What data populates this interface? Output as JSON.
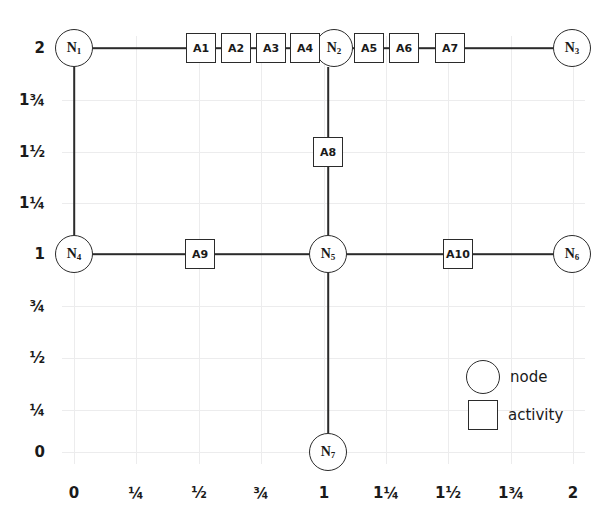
{
  "diagram": {
    "background_color": "#ffffff",
    "line_color": "#2b2b2b",
    "grid_color": "#ececed"
  },
  "axes": {
    "x": {
      "ticks": [
        "0",
        "¼",
        "½",
        "¾",
        "1",
        "1¼",
        "1½",
        "1¾",
        "2"
      ],
      "positions_px": [
        74,
        136,
        199,
        261,
        324,
        386,
        448,
        511,
        573
      ],
      "label_y_px": 486,
      "range": [
        0,
        2
      ]
    },
    "y": {
      "ticks": [
        "2",
        "1¾",
        "1½",
        "1¼",
        "1",
        "¾",
        "½",
        "¼",
        "0"
      ],
      "positions_px": [
        48,
        100,
        152,
        203,
        254,
        306,
        358,
        410,
        452
      ],
      "label_x_px": 45,
      "range": [
        0,
        2
      ]
    }
  },
  "nodes": [
    {
      "id": "N1",
      "label": "N",
      "sub": "1",
      "x": 74,
      "y": 48,
      "coord": [
        0,
        2
      ]
    },
    {
      "id": "N2",
      "label": "N",
      "sub": "2",
      "x": 334,
      "y": 48,
      "coord": [
        1,
        2
      ]
    },
    {
      "id": "N3",
      "label": "N",
      "sub": "3",
      "x": 572,
      "y": 48,
      "coord": [
        2,
        2
      ]
    },
    {
      "id": "N4",
      "label": "N",
      "sub": "4",
      "x": 74,
      "y": 254,
      "coord": [
        0,
        1
      ]
    },
    {
      "id": "N5",
      "label": "N",
      "sub": "5",
      "x": 328,
      "y": 254,
      "coord": [
        1,
        1
      ]
    },
    {
      "id": "N6",
      "label": "N",
      "sub": "6",
      "x": 572,
      "y": 254,
      "coord": [
        2,
        1
      ]
    },
    {
      "id": "N7",
      "label": "N",
      "sub": "7",
      "x": 328,
      "y": 452,
      "coord": [
        1,
        0
      ]
    }
  ],
  "activities": [
    {
      "id": "A1",
      "label": "A1",
      "x": 201,
      "y": 48
    },
    {
      "id": "A2",
      "label": "A2",
      "x": 236,
      "y": 48
    },
    {
      "id": "A3",
      "label": "A3",
      "x": 271,
      "y": 48
    },
    {
      "id": "A4",
      "label": "A4",
      "x": 305,
      "y": 48
    },
    {
      "id": "A5",
      "label": "A5",
      "x": 369,
      "y": 48
    },
    {
      "id": "A6",
      "label": "A6",
      "x": 404,
      "y": 48
    },
    {
      "id": "A7",
      "label": "A7",
      "x": 450,
      "y": 48
    },
    {
      "id": "A8",
      "label": "A8",
      "x": 328,
      "y": 152
    },
    {
      "id": "A9",
      "label": "A9",
      "x": 200,
      "y": 254
    },
    {
      "id": "A10",
      "label": "A10",
      "x": 458,
      "y": 254
    }
  ],
  "edges": [
    {
      "from": "N1",
      "to": "N2",
      "orientation": "horizontal",
      "y": 48,
      "x1": 93,
      "x2": 315
    },
    {
      "from": "N2",
      "to": "N3",
      "orientation": "horizontal",
      "y": 48,
      "x1": 353,
      "x2": 553
    },
    {
      "from": "N1",
      "to": "N4",
      "orientation": "vertical",
      "x": 74,
      "y1": 67,
      "y2": 235
    },
    {
      "from": "N2",
      "to": "N5",
      "orientation": "vertical",
      "x": 328,
      "y1": 67,
      "y2": 235
    },
    {
      "from": "N4",
      "to": "N5",
      "orientation": "horizontal",
      "y": 254,
      "x1": 93,
      "x2": 309
    },
    {
      "from": "N5",
      "to": "N6",
      "orientation": "horizontal",
      "y": 254,
      "x1": 347,
      "x2": 553
    },
    {
      "from": "N5",
      "to": "N7",
      "orientation": "vertical",
      "x": 328,
      "y1": 273,
      "y2": 433
    }
  ],
  "legend": {
    "items": [
      {
        "shape": "circle",
        "label": "node"
      },
      {
        "shape": "square",
        "label": "activity"
      }
    ]
  }
}
